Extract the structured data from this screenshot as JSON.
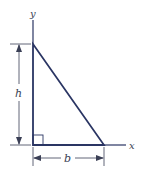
{
  "diagram": {
    "type": "right-triangle-geometry",
    "labels": {
      "y_axis": "y",
      "x_axis": "x",
      "height": "h",
      "base": "b"
    },
    "colors": {
      "triangle_stroke": "#2a3563",
      "dimension_stroke": "#3a3f55",
      "background": "#ffffff"
    },
    "vertices": {
      "top": [
        33,
        44
      ],
      "origin": [
        33,
        145
      ],
      "right": [
        104,
        145
      ]
    }
  }
}
